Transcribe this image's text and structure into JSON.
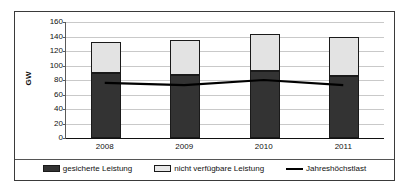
{
  "chart_data": {
    "type": "bar",
    "subtype": "stacked-bar-with-line-overlay",
    "title": "",
    "xlabel": "",
    "ylabel": "GW",
    "ylim": [
      0,
      160
    ],
    "ytick_step": 20,
    "yticks": [
      160,
      140,
      120,
      100,
      80,
      60,
      40,
      20,
      0
    ],
    "grid": true,
    "legend_position": "bottom",
    "categories": [
      "2008",
      "2009",
      "2010",
      "2011"
    ],
    "series": [
      {
        "name": "gesicherte Leistung",
        "kind": "bar-segment",
        "color": "#333333",
        "values": [
          90,
          87,
          93,
          86
        ]
      },
      {
        "name": "nicht verfügbare Leistung",
        "kind": "bar-segment",
        "color": "#e3e3e3",
        "values": [
          42,
          48,
          51,
          53
        ]
      },
      {
        "name": "Jahreshöchstlast",
        "kind": "line",
        "color": "#000000",
        "values": [
          76,
          73,
          80,
          73
        ]
      }
    ],
    "bar_totals": [
      132,
      135,
      144,
      139
    ]
  },
  "axis": {
    "y_title": "GW",
    "y_labels": [
      "160",
      "140",
      "120",
      "100",
      "80",
      "60",
      "40",
      "20",
      "0"
    ],
    "x_labels": [
      "2008",
      "2009",
      "2010",
      "2011"
    ]
  },
  "legend": {
    "items": [
      {
        "label": "gesicherte Leistung",
        "icon": "filled-dark-square-swatch"
      },
      {
        "label": "nicht verfügbare Leistung",
        "icon": "filled-light-square-swatch"
      },
      {
        "label": "Jahreshöchstlast",
        "icon": "line-swatch"
      }
    ]
  },
  "colors": {
    "secured": "#333333",
    "unavailable": "#e3e3e3",
    "line": "#000000",
    "grid": "#c9c9c9",
    "frame": "#3a3a3a"
  }
}
